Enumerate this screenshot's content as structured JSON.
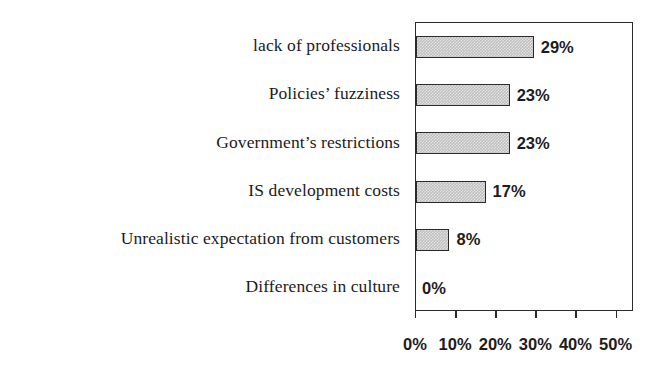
{
  "chart_data": {
    "type": "bar",
    "orientation": "horizontal",
    "title": "",
    "subtitle": "",
    "xlabel": "",
    "ylabel": "",
    "xlim": [
      0,
      50
    ],
    "grid": false,
    "legend": null,
    "categories": [
      "lack of professionals",
      "Policies’ fuzziness",
      "Government’s restrictions",
      "IS development costs",
      "Unrealistic expectation from customers",
      "Differences in culture"
    ],
    "values": [
      29,
      23,
      23,
      17,
      8,
      0
    ],
    "value_labels": [
      "29%",
      "23%",
      "23%",
      "17%",
      "8%",
      "0%"
    ],
    "xticks": [
      0,
      10,
      20,
      30,
      40,
      50
    ],
    "xtick_labels": [
      "0%",
      "10%",
      "20%",
      "30%",
      "40%",
      "50%"
    ],
    "bar_fill_color": "#bfbfbf",
    "bar_edge_color": "#2b2b2b",
    "frame_color": "#2b2b2b",
    "background_color": "#ffffff",
    "text_color": "#1b1b1b"
  }
}
